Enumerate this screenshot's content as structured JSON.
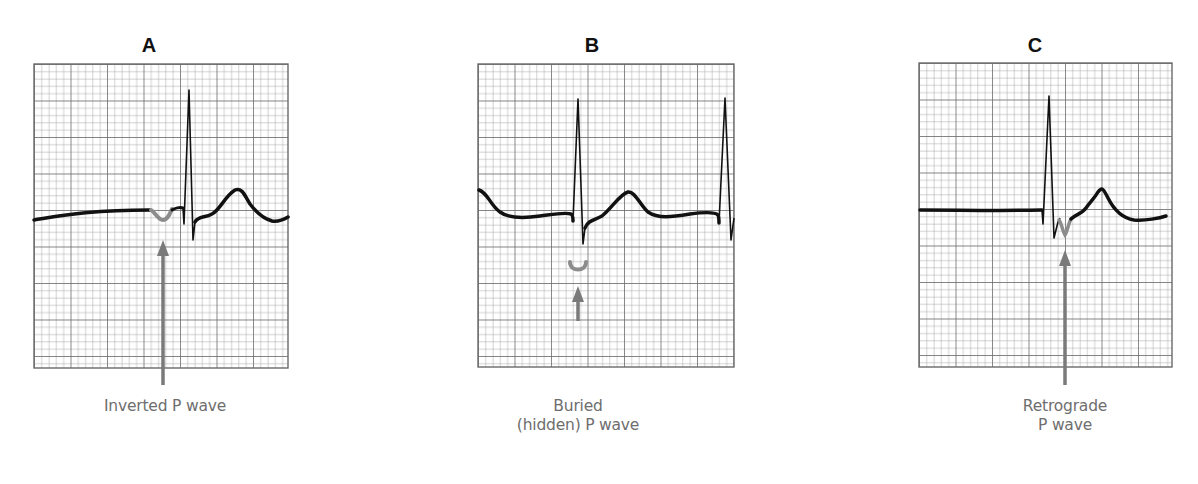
{
  "figure": {
    "panels": [
      {
        "id": "A",
        "title": "A",
        "caption_lines": [
          "Inverted P wave"
        ],
        "annotation": "inverted-p-wave"
      },
      {
        "id": "B",
        "title": "B",
        "caption_lines": [
          "Buried",
          "(hidden) P wave"
        ],
        "annotation": "buried-p-wave"
      },
      {
        "id": "C",
        "title": "C",
        "caption_lines": [
          "Retrograde",
          "P wave"
        ],
        "annotation": "retrograde-p-wave"
      }
    ],
    "colors": {
      "grid_minor": "#9a9a9a",
      "grid_major": "#6a6a6a",
      "trace": "#111111",
      "p_wave_highlight": "#8c8c8c",
      "arrow": "#7a7a7a",
      "caption_text": "#6e6e6e"
    }
  }
}
